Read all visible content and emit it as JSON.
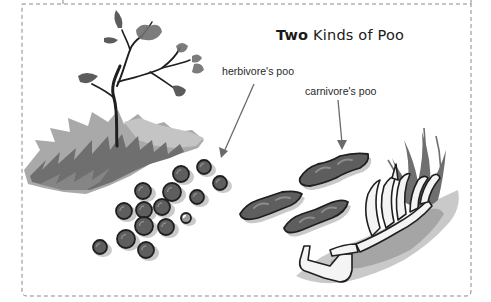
{
  "figure": {
    "title": {
      "bold_part": "Two",
      "rest": " Kinds of Poo"
    },
    "labels": {
      "herbivore": "herbivore's poo",
      "carnivore": "carnivore's poo"
    },
    "colors": {
      "frame_dash": "#8a8a8a",
      "outline": "#1f1f1f",
      "poo_fill": "#5e5e5e",
      "poo_highlight": "#8c8c8c",
      "grass_dark": "#6f6f6f",
      "grass_light": "#a9a9a9",
      "shadow": "#c9c9c9",
      "bone": "#f4f4f4",
      "arrow": "#6a6a6a"
    },
    "herbivore_pellets": [
      {
        "cx": 204,
        "cy": 167,
        "r": 7
      },
      {
        "cx": 181,
        "cy": 174,
        "r": 8
      },
      {
        "cx": 220,
        "cy": 183,
        "r": 7
      },
      {
        "cx": 143,
        "cy": 191,
        "r": 8
      },
      {
        "cx": 172,
        "cy": 192,
        "r": 9
      },
      {
        "cx": 197,
        "cy": 197,
        "r": 7
      },
      {
        "cx": 124,
        "cy": 211,
        "r": 8
      },
      {
        "cx": 144,
        "cy": 210,
        "r": 8
      },
      {
        "cx": 162,
        "cy": 207,
        "r": 8
      },
      {
        "cx": 186,
        "cy": 218,
        "r": 5,
        "light": true
      },
      {
        "cx": 144,
        "cy": 226,
        "r": 9
      },
      {
        "cx": 166,
        "cy": 227,
        "r": 8
      },
      {
        "cx": 126,
        "cy": 239,
        "r": 9
      },
      {
        "cx": 100,
        "cy": 247,
        "r": 7
      },
      {
        "cx": 146,
        "cy": 250,
        "r": 8
      }
    ]
  }
}
